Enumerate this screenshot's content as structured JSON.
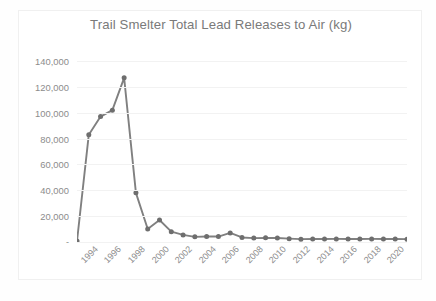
{
  "chart_data": {
    "type": "line",
    "title": "Trail Smelter Total Lead Releases to Air (kg)",
    "xlabel": "",
    "ylabel": "",
    "grid": true,
    "legend": false,
    "ylim": [
      0,
      140000
    ],
    "ytick_labels": [
      "140,000",
      "120,000",
      "100,000",
      "80,000",
      "60,000",
      "40,000",
      "20,000",
      "-"
    ],
    "ytick_values": [
      140000,
      120000,
      100000,
      80000,
      60000,
      40000,
      20000,
      0
    ],
    "xtick_labels": [
      "1994",
      "1996",
      "1998",
      "2000",
      "2002",
      "2004",
      "2006",
      "2008",
      "2010",
      "2012",
      "2014",
      "2016",
      "2018",
      "2020"
    ],
    "xtick_values": [
      1994,
      1996,
      1998,
      2000,
      2002,
      2004,
      2006,
      2008,
      2010,
      2012,
      2014,
      2016,
      2018,
      2020
    ],
    "x": [
      1993,
      1994,
      1995,
      1996,
      1997,
      1998,
      1999,
      2000,
      2001,
      2002,
      2003,
      2004,
      2005,
      2006,
      2007,
      2008,
      2009,
      2010,
      2011,
      2012,
      2013,
      2014,
      2015,
      2016,
      2017,
      2018,
      2019,
      2020,
      2021
    ],
    "values": [
      700,
      83000,
      97000,
      102000,
      127000,
      38000,
      10000,
      17000,
      8000,
      5500,
      4000,
      4200,
      4200,
      7000,
      3500,
      3000,
      3200,
      3100,
      2600,
      2200,
      2400,
      2300,
      2400,
      2300,
      2300,
      2400,
      2300,
      2300,
      2200
    ],
    "series": [
      {
        "name": "Total Lead Releases to Air (kg)",
        "values": [
          700,
          83000,
          97000,
          102000,
          127000,
          38000,
          10000,
          17000,
          8000,
          5500,
          4000,
          4200,
          4200,
          7000,
          3500,
          3000,
          3200,
          3100,
          2600,
          2200,
          2400,
          2300,
          2400,
          2300,
          2300,
          2400,
          2300,
          2300,
          2200
        ],
        "color": "#808080",
        "marker": "circle"
      }
    ],
    "colors": {
      "line": "#808080",
      "marker": "#6e6e6e",
      "gridline": "#f2f2f2",
      "text": "#8c8c8c",
      "title": "#7a7a7a",
      "plot_background": "#ffffff",
      "frame_border": "#f0f0f0"
    }
  }
}
